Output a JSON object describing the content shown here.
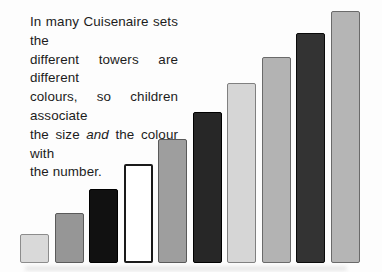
{
  "figure": {
    "background": "#fdfdfd",
    "note": {
      "line1": "In many Cuisenaire sets the",
      "line2": "different towers are different",
      "line3": "colours, so children associate",
      "line4_before": "the size",
      "line4_italic": "and",
      "line4_after": "the colour with",
      "line5": "the number."
    }
  },
  "chart_data": {
    "type": "bar",
    "title": "",
    "xlabel": "",
    "ylabel": "",
    "categories": [
      "1",
      "2",
      "3",
      "4",
      "5",
      "6",
      "7",
      "8",
      "9",
      "10"
    ],
    "values": [
      1,
      2,
      3,
      4,
      5,
      6,
      7,
      8,
      9,
      10
    ],
    "grid": false,
    "legend": "none",
    "axes": "none",
    "baseline_y_px": 263,
    "bar_width_px": 29,
    "bar_pitch_px": 34.5,
    "first_bar_left_px": 20,
    "bars": [
      {
        "value": 1,
        "height_px": 29,
        "fill": "#d9d9d9",
        "border": "#8c8c8c",
        "border_px": 1.5
      },
      {
        "value": 2,
        "height_px": 50,
        "fill": "#969696",
        "border": "#5a5a5a",
        "border_px": 1.5
      },
      {
        "value": 3,
        "height_px": 74,
        "fill": "#111111",
        "border": "#000000",
        "border_px": 1.5
      },
      {
        "value": 4,
        "height_px": 99,
        "fill": "#ffffff",
        "border": "#1a1a1a",
        "border_px": 2
      },
      {
        "value": 5,
        "height_px": 124,
        "fill": "#9e9e9e",
        "border": "#5a5a5a",
        "border_px": 1.5
      },
      {
        "value": 6,
        "height_px": 151,
        "fill": "#272727",
        "border": "#000000",
        "border_px": 1.5
      },
      {
        "value": 7,
        "height_px": 180,
        "fill": "#d6d6d6",
        "border": "#808080",
        "border_px": 1.5
      },
      {
        "value": 8,
        "height_px": 206,
        "fill": "#b3b3b3",
        "border": "#6a6a6a",
        "border_px": 1.5
      },
      {
        "value": 9,
        "height_px": 230,
        "fill": "#333333",
        "border": "#0a0a0a",
        "border_px": 1.5
      },
      {
        "value": 10,
        "height_px": 252,
        "fill": "#b5b5b5",
        "border": "#6a6a6a",
        "border_px": 1.5
      }
    ]
  }
}
